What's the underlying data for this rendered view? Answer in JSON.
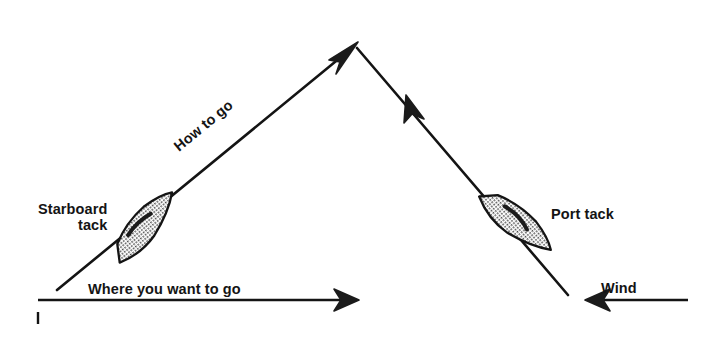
{
  "figure": {
    "background_color": "#ffffff",
    "ink_color": "#141414",
    "hull_fill_color": "#b4b4b4",
    "hull_stroke_color": "#141414",
    "width": 720,
    "height": 347
  },
  "labels": {
    "starboard_tack_line1": "Starboard",
    "starboard_tack_line2": "tack",
    "port_tack": "Port tack",
    "how_to_go": "How to go",
    "where_you_want_to_go": "Where you want to go",
    "wind": "Wind",
    "figure_marker": "i"
  },
  "diagram_data": {
    "type": "line-art-diagram",
    "description": "Sailing tacking diagram showing a zigzag upwind course. A boat cannot sail directly into the wind, so it beats upwind on alternating starboard and port tacks.",
    "vertices": {
      "left_start": [
        57,
        290
      ],
      "apex": [
        355,
        45
      ],
      "right_end": [
        568,
        295
      ]
    },
    "paths": [
      {
        "name": "starboard-tack-leg",
        "from": [
          57,
          290
        ],
        "to": [
          355,
          45
        ],
        "arrowhead_at": "end",
        "arrow_direction": "up-right",
        "angle_degrees": -39.4
      },
      {
        "name": "port-tack-leg",
        "from": [
          355,
          45
        ],
        "to": [
          568,
          295
        ],
        "arrowhead_at": [
          418,
          110
        ],
        "arrow_direction": "up-left",
        "angle_degrees": 49.6
      },
      {
        "name": "desired-course-arrow",
        "from": [
          38,
          300
        ],
        "to": [
          358,
          300
        ],
        "arrowhead_at": "end",
        "arrow_direction": "right"
      },
      {
        "name": "wind-direction-arrow",
        "from": [
          688,
          300
        ],
        "to": [
          588,
          300
        ],
        "arrowhead_at": "end",
        "arrow_direction": "left"
      }
    ],
    "boats": [
      {
        "name": "starboard-tack-boat",
        "center": [
          143,
          228
        ],
        "rotation_degrees": -39.4,
        "fill": "hatched-gray"
      },
      {
        "name": "port-tack-boat",
        "center": [
          514,
          222
        ],
        "rotation_degrees": 49.6,
        "fill": "hatched-gray"
      }
    ]
  }
}
